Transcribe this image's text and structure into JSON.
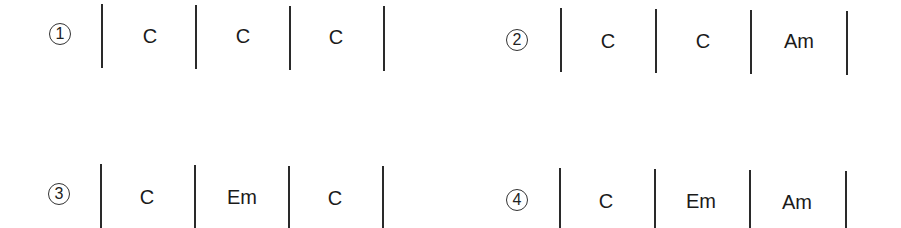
{
  "progressions": [
    {
      "label": "1",
      "symbol": "①",
      "chords": [
        "C",
        "C",
        "C"
      ]
    },
    {
      "label": "2",
      "symbol": "②",
      "chords": [
        "C",
        "C",
        "Am"
      ]
    },
    {
      "label": "3",
      "symbol": "③",
      "chords": [
        "C",
        "Em",
        "C"
      ]
    },
    {
      "label": "4",
      "symbol": "④",
      "chords": [
        "C",
        "Em",
        "Am"
      ]
    }
  ],
  "colors": {
    "ink": "#1a1a1a",
    "background": "#ffffff"
  }
}
